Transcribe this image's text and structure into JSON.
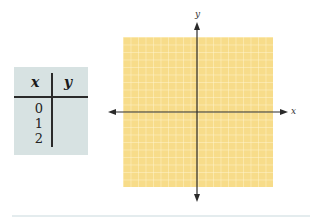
{
  "table": {
    "headers": [
      "x",
      "y"
    ],
    "rows": [
      {
        "x": "0",
        "y": ""
      },
      {
        "x": "1",
        "y": ""
      },
      {
        "x": "2",
        "y": ""
      }
    ]
  },
  "graph": {
    "x_axis_label": "x",
    "y_axis_label": "y",
    "grid_cells_per_side": 20,
    "grid_fill": "#f7dc8a",
    "grid_line": "#fff3d0",
    "axis_color": "#2a2a2a"
  },
  "colors": {
    "table_bg": "#d7e2e2"
  }
}
